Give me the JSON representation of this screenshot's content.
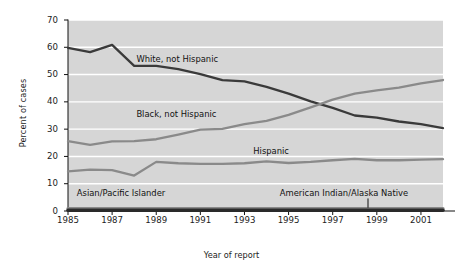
{
  "chart_data": {
    "type": "line",
    "title": "",
    "xlabel": "Year of report",
    "ylabel": "Percent of cases",
    "xlim": [
      1985,
      2002
    ],
    "ylim": [
      0,
      70
    ],
    "ytick_values": [
      0,
      10,
      20,
      30,
      40,
      50,
      60,
      70
    ],
    "ytick_labels": [
      "0",
      "10",
      "20",
      "30",
      "40",
      "50",
      "60",
      "70"
    ],
    "xtick_values": [
      1985,
      1987,
      1989,
      1991,
      1993,
      1995,
      1997,
      1999,
      2001
    ],
    "xtick_labels": [
      "1985",
      "1987",
      "1989",
      "1991",
      "1993",
      "1995",
      "1997",
      "1999",
      "2001"
    ],
    "grid": "horizontal-white",
    "plot_background": "#d6d6d6",
    "legend_position": "inline-annotations",
    "x": [
      1985,
      1986,
      1987,
      1988,
      1989,
      1990,
      1991,
      1992,
      1993,
      1994,
      1995,
      1996,
      1997,
      1998,
      1999,
      2000,
      2001,
      2002
    ],
    "series": [
      {
        "name": "White, not Hispanic",
        "color": "#3a3a3a",
        "label": "White, not Hispanic",
        "label_x": 1988.1,
        "label_y": 55.5,
        "values": [
          59.8,
          58.2,
          60.9,
          53.2,
          53.2,
          52.0,
          50.2,
          48.0,
          47.5,
          45.5,
          43.0,
          40.2,
          37.8,
          35.0,
          34.2,
          32.8,
          31.8,
          30.4
        ]
      },
      {
        "name": "Black, not Hispanic",
        "color": "#8a8a8a",
        "label": "Black, not Hispanic",
        "label_x": 1988.1,
        "label_y": 35.2,
        "values": [
          25.6,
          24.2,
          25.5,
          25.6,
          26.3,
          28.0,
          29.8,
          30.1,
          31.8,
          33.0,
          35.2,
          38.0,
          40.8,
          43.0,
          44.2,
          45.2,
          46.8,
          48.0
        ]
      },
      {
        "name": "Hispanic",
        "color": "#8a8a8a",
        "label": "Hispanic",
        "label_x": 1993.4,
        "label_y": 21.5,
        "values": [
          14.5,
          15.2,
          15.0,
          13.0,
          18.0,
          17.5,
          17.3,
          17.3,
          17.5,
          18.2,
          17.6,
          18.0,
          18.6,
          19.1,
          18.6,
          18.6,
          18.8,
          19.0
        ]
      },
      {
        "name": "Asian/Pacific Islander",
        "color": "#8a8a8a",
        "label": "Asian/Pacific Islander",
        "label_x": 1985.4,
        "label_y": 6.2,
        "values": [
          0.8,
          0.8,
          0.8,
          0.8,
          0.8,
          0.8,
          0.8,
          0.8,
          0.8,
          0.8,
          0.8,
          0.8,
          0.8,
          0.8,
          0.8,
          0.8,
          0.8,
          0.8
        ]
      },
      {
        "name": "American Indian/Alaska Native",
        "color": "#2a2a2a",
        "label": "American Indian/Alaska Native",
        "label_x": 1994.6,
        "label_y": 6.2,
        "values": [
          0.3,
          0.3,
          0.3,
          0.3,
          0.3,
          0.3,
          0.3,
          0.3,
          0.3,
          0.3,
          0.3,
          0.3,
          0.3,
          0.3,
          0.3,
          0.3,
          0.3,
          0.3
        ]
      }
    ],
    "leader_line": {
      "x": 1998.6,
      "y_top": 4.6,
      "y_bottom": 1.2
    }
  }
}
